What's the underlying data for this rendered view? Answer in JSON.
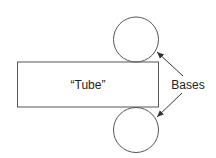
{
  "diagram": {
    "tube_label": "“Tube”",
    "bases_label": "Bases",
    "colors": {
      "stroke": "#444444",
      "text": "#222222",
      "background": "#ffffff"
    },
    "shapes": {
      "rectangle": {
        "x": 17,
        "y": 62,
        "width": 141,
        "height": 45
      },
      "top_circle": {
        "cx": 136,
        "cy": 39.5,
        "r": 22.5
      },
      "bottom_circle": {
        "cx": 136,
        "cy": 130,
        "r": 22.5
      }
    }
  }
}
